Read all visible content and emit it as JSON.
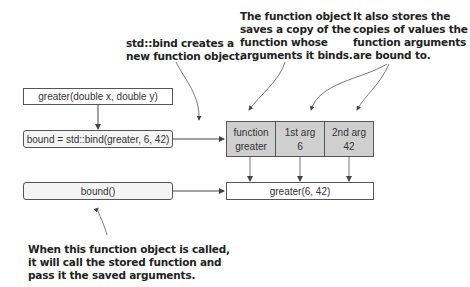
{
  "annotations": {
    "bind_creates": [
      "std::bind creates a",
      "new function object."
    ],
    "saves_copy": [
      "The function object",
      "saves a copy of the",
      "function whose",
      "arguments it binds."
    ],
    "stores_copies": [
      "It also stores the",
      "copies of values the",
      "function arguments",
      "are bound to."
    ],
    "when_called": [
      "When this function object is called,",
      "it will call the stored function and",
      "pass it the saved arguments."
    ]
  },
  "boxes": {
    "greater_decl": "greater(double x, double y)",
    "bind_stmt": "bound = std::bind(greater, 6, 42)",
    "bound_call": "bound()",
    "result_call": "greater(6, 42)"
  },
  "function_object": {
    "cells": [
      {
        "header": "function",
        "value": "greater"
      },
      {
        "header": "1st arg",
        "value": "6"
      },
      {
        "header": "2nd arg",
        "value": "42"
      }
    ]
  },
  "colors": {
    "stroke": "#555555",
    "cell_fill": "#cfcfcf",
    "rounded_fill": "#f4f4f4"
  }
}
